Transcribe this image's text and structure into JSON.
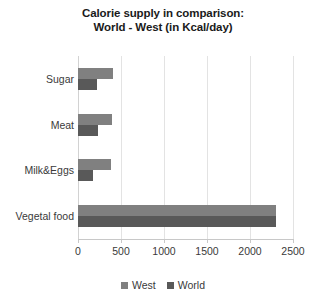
{
  "chart_data": {
    "type": "bar",
    "orientation": "horizontal",
    "title": "Calorie supply in comparison: World - West (in Kcal/day)",
    "title_lines": [
      "Calorie supply in comparison:",
      "World - West (in Kcal/day)"
    ],
    "categories": [
      "Sugar",
      "Meat",
      "Milk&Eggs",
      "Vegetal food"
    ],
    "series": [
      {
        "name": "West",
        "color": "#808080",
        "values": [
          410,
          400,
          380,
          2300
        ]
      },
      {
        "name": "World",
        "color": "#595959",
        "values": [
          220,
          230,
          170,
          2300
        ]
      }
    ],
    "xlabel": "",
    "ylabel": "",
    "xlim": [
      0,
      2500
    ],
    "xticks": [
      0,
      500,
      1000,
      1500,
      2000,
      2500
    ],
    "xtick_labels": [
      "0",
      "500",
      "1000",
      "1500",
      "2000",
      "2500"
    ],
    "grid": true,
    "grid_axis": "x",
    "legend": [
      "West",
      "World"
    ],
    "legend_position": "bottom-center"
  },
  "colors": {
    "west": "#808080",
    "world": "#595959",
    "grid": "#e3e3e3",
    "axis": "#c8c8c8",
    "text": "#3a3a3a",
    "title": "#1a1a1a",
    "background": "#ffffff"
  }
}
